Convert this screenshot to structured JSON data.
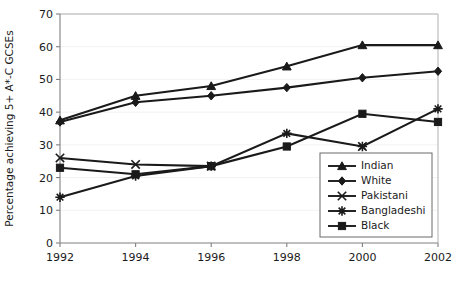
{
  "chart_data": {
    "type": "line",
    "title": "",
    "xlabel": "",
    "ylabel": "Percentage achieving 5+ A*-C GCSEs",
    "x": [
      1992,
      1994,
      1996,
      1998,
      2000,
      2002
    ],
    "xtick_labels": [
      "1992",
      "1994",
      "1996",
      "1998",
      "2000",
      "2002"
    ],
    "ylim": [
      0,
      70
    ],
    "yticks": [
      0,
      10,
      20,
      30,
      40,
      50,
      60,
      70
    ],
    "ytick_labels": [
      "0",
      "10",
      "20",
      "30",
      "40",
      "50",
      "60",
      "70"
    ],
    "grid": true,
    "legend_position": "lower-right",
    "series": [
      {
        "name": "Indian",
        "marker": "triangle",
        "color": "#1a1a1a",
        "values": [
          37.5,
          45.0,
          48.0,
          54.0,
          60.5,
          60.5
        ]
      },
      {
        "name": "White",
        "marker": "diamond",
        "color": "#1a1a1a",
        "values": [
          37.0,
          43.0,
          45.0,
          47.5,
          50.5,
          52.5
        ]
      },
      {
        "name": "Pakistani",
        "marker": "cross",
        "color": "#1a1a1a",
        "values": [
          26.0,
          24.0,
          23.5,
          null,
          29.5,
          null
        ]
      },
      {
        "name": "Bangladeshi",
        "marker": "asterisk",
        "color": "#1a1a1a",
        "values": [
          14.0,
          20.5,
          23.5,
          33.5,
          29.5,
          41.0
        ]
      },
      {
        "name": "Black",
        "marker": "square",
        "color": "#1a1a1a",
        "values": [
          23.0,
          21.0,
          23.5,
          29.5,
          39.5,
          37.0
        ]
      }
    ]
  }
}
